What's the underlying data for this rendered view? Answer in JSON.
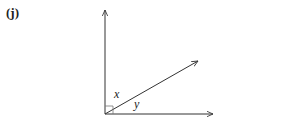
{
  "part_label": "(j)",
  "diagram": {
    "type": "angle-diagram",
    "vertex": [
      105,
      114
    ],
    "rays": [
      {
        "name": "vertical-ray",
        "end": [
          105,
          10
        ]
      },
      {
        "name": "diagonal-ray",
        "end": [
          198,
          61
        ]
      },
      {
        "name": "horizontal-ray",
        "end": [
          213,
          114
        ]
      }
    ],
    "right_angle_marker": true,
    "angles": [
      {
        "label": "x",
        "between": [
          "vertical-ray",
          "diagonal-ray"
        ]
      },
      {
        "label": "y",
        "between": [
          "diagonal-ray",
          "horizontal-ray"
        ]
      }
    ]
  },
  "labels": {
    "x": "x",
    "y": "y"
  },
  "colors": {
    "line": "#333333",
    "marker": "#666666"
  }
}
